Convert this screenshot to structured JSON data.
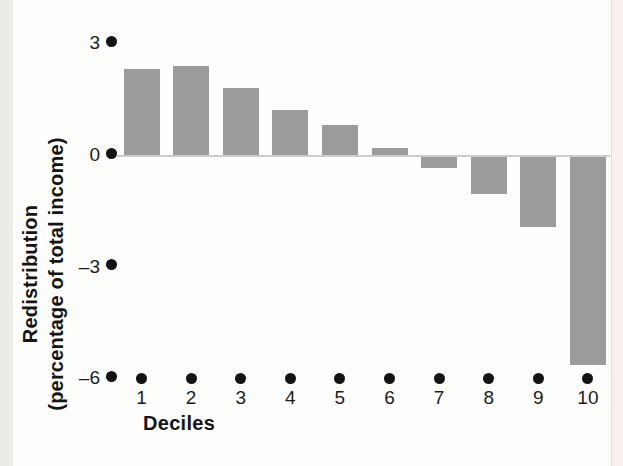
{
  "figure": {
    "background_color": "#fdfdfc",
    "left_band_color": "#ecebe8",
    "right_band_color": "#f7f0ee"
  },
  "chart_data": {
    "type": "bar",
    "title": "",
    "xlabel": "Deciles",
    "ylabel": "Redistribution (percentage of total income)",
    "ylabel_line1": "Redistribution",
    "ylabel_line2": "(percentage of total income)",
    "categories": [
      "1",
      "2",
      "3",
      "4",
      "5",
      "6",
      "7",
      "8",
      "9",
      "10"
    ],
    "values": [
      2.3,
      2.4,
      1.8,
      1.2,
      0.8,
      0.2,
      -0.3,
      -1.0,
      -1.9,
      -5.6
    ],
    "ylim": [
      -6,
      3
    ],
    "yticks": [
      {
        "value": 3,
        "label": "3"
      },
      {
        "value": 0,
        "label": "0"
      },
      {
        "value": -3,
        "label": "–3"
      },
      {
        "value": -6,
        "label": "–6"
      }
    ],
    "tick_marker_style": "filled-circle",
    "tick_marker_color": "#131313",
    "bar_color": "#9b9b9b",
    "zero_line_color": "#cbcbc9",
    "grid": "off",
    "legend": "none"
  }
}
